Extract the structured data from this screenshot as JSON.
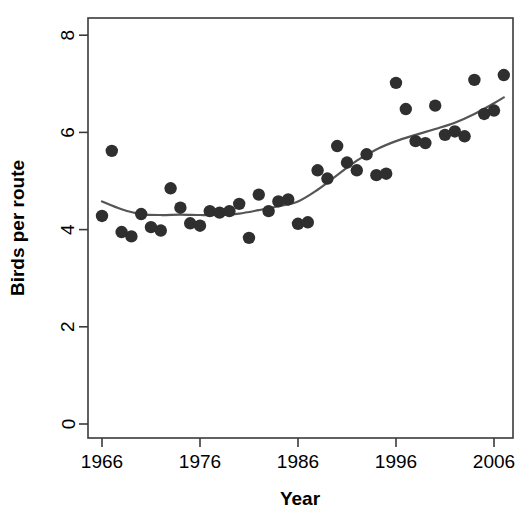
{
  "chart_data": {
    "type": "scatter",
    "title": "",
    "xlabel": "Year",
    "ylabel": "Birds per route",
    "xlim": [
      1965,
      2008
    ],
    "ylim": [
      0,
      8.4
    ],
    "xticks": [
      1966,
      1976,
      1986,
      1996,
      2006
    ],
    "xtick_labels": [
      "1966",
      "1976",
      "1986",
      "1996",
      "2006"
    ],
    "yticks": [
      0,
      2,
      4,
      6,
      8
    ],
    "ytick_labels": [
      "0",
      "2",
      "4",
      "6",
      "8"
    ],
    "grid": false,
    "legend": "none",
    "point_color": "#2f2f2f",
    "line_color": "#555555",
    "series": [
      {
        "name": "Birds per route",
        "type": "scatter",
        "x": [
          1966,
          1967,
          1968,
          1969,
          1970,
          1971,
          1972,
          1973,
          1974,
          1975,
          1976,
          1977,
          1978,
          1979,
          1980,
          1981,
          1982,
          1983,
          1984,
          1985,
          1986,
          1987,
          1988,
          1989,
          1990,
          1991,
          1992,
          1993,
          1994,
          1995,
          1996,
          1997,
          1998,
          1999,
          2000,
          2001,
          2002,
          2003,
          2004,
          2005,
          2006,
          2007
        ],
        "y": [
          4.28,
          5.62,
          3.95,
          3.86,
          4.32,
          4.05,
          3.98,
          4.85,
          4.45,
          4.13,
          4.08,
          4.38,
          4.35,
          4.38,
          4.53,
          3.83,
          4.72,
          4.38,
          4.58,
          4.62,
          4.12,
          4.15,
          5.22,
          5.05,
          5.72,
          5.38,
          5.22,
          5.55,
          5.12,
          5.15,
          7.02,
          6.48,
          5.82,
          5.78,
          6.55,
          5.95,
          6.02,
          5.92,
          7.08,
          6.38,
          6.45,
          7.18
        ]
      },
      {
        "name": "Smoothed trend",
        "type": "line",
        "x": [
          1966,
          1968,
          1970,
          1972,
          1974,
          1976,
          1978,
          1980,
          1982,
          1984,
          1986,
          1988,
          1990,
          1992,
          1994,
          1996,
          1998,
          2000,
          2002,
          2004,
          2006,
          2007
        ],
        "y": [
          4.58,
          4.42,
          4.32,
          4.3,
          4.31,
          4.3,
          4.3,
          4.33,
          4.4,
          4.48,
          4.58,
          4.82,
          5.12,
          5.42,
          5.65,
          5.82,
          5.95,
          6.07,
          6.2,
          6.38,
          6.6,
          6.72
        ]
      }
    ]
  },
  "geometry": {
    "plot_left": 88,
    "plot_right": 513,
    "plot_top": 18,
    "plot_bottom": 438,
    "x_origin_px": 102,
    "px_per_year": 9.8,
    "y_zero_px": 424,
    "px_per_unit": 48.6,
    "point_radius": 6.2
  }
}
